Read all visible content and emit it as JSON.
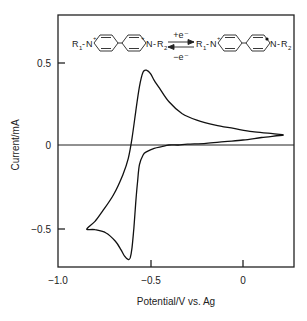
{
  "chart_data": {
    "type": "line",
    "title": "",
    "xlabel": "Potential/V vs. Ag",
    "ylabel": "Current/mA",
    "xlim": [
      -1.1,
      0.27
    ],
    "ylim": [
      -0.74,
      0.78
    ],
    "xticks": [
      -1.0,
      -0.5,
      0
    ],
    "xtick_labels": [
      "−1.0",
      "−0.5",
      "0"
    ],
    "yticks": [
      -0.5,
      0,
      0.5
    ],
    "ytick_labels": [
      "−0.5",
      "0",
      "0.5"
    ],
    "grid": false,
    "legend": null,
    "zero_line": true,
    "series": [
      {
        "name": "cyclic voltammogram",
        "x": [
          0.22,
          0.15,
          0.05,
          -0.05,
          -0.15,
          -0.25,
          -0.33,
          -0.4,
          -0.45,
          -0.48,
          -0.5,
          -0.52,
          -0.54,
          -0.56,
          -0.58,
          -0.6,
          -0.62,
          -0.65,
          -0.7,
          -0.76,
          -0.8,
          -0.84,
          -0.84,
          -0.8,
          -0.74,
          -0.69,
          -0.66,
          -0.64,
          -0.62,
          -0.61,
          -0.6,
          -0.59,
          -0.58,
          -0.57,
          -0.56,
          -0.54,
          -0.52,
          -0.48,
          -0.44,
          -0.4,
          -0.35,
          -0.3,
          -0.2,
          -0.1,
          0.0,
          0.1,
          0.22
        ],
        "y": [
          0.06,
          0.07,
          0.08,
          0.1,
          0.12,
          0.15,
          0.19,
          0.26,
          0.34,
          0.39,
          0.43,
          0.45,
          0.44,
          0.35,
          0.2,
          0.04,
          -0.08,
          -0.18,
          -0.3,
          -0.4,
          -0.46,
          -0.5,
          -0.51,
          -0.51,
          -0.53,
          -0.58,
          -0.63,
          -0.67,
          -0.69,
          -0.68,
          -0.62,
          -0.5,
          -0.35,
          -0.22,
          -0.12,
          -0.06,
          -0.04,
          -0.02,
          -0.01,
          0.0,
          0.0,
          0.005,
          0.01,
          0.02,
          0.03,
          0.045,
          0.06
        ]
      }
    ],
    "annotations": [
      {
        "type": "reaction_scheme",
        "reactant": "R1-N+ (pyridinium)-(pyridinium) N+-R2",
        "product": "R1-N+ (pyridinium)-(pyridinyl radical) •N-R2",
        "forward": "+e⁻",
        "reverse": "−e⁻"
      }
    ]
  },
  "labels": {
    "xlabel": "Potential/V vs. Ag",
    "ylabel": "Current/mA",
    "xt0": "−1.0",
    "xt1": "−0.5",
    "xt2": "0",
    "yt0": "0.5",
    "yt1": "0",
    "yt2": "−0.5",
    "r1": "R",
    "r1sub": "1",
    "r2": "R",
    "r2sub": "2",
    "n": "N",
    "plus": "+",
    "forward": "+e⁻",
    "reverse": "−e⁻",
    "dash": "-"
  }
}
